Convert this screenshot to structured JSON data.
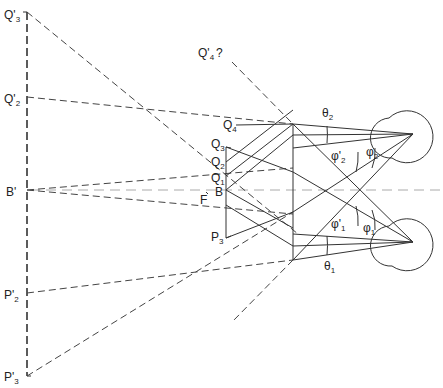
{
  "diagram": {
    "labels": {
      "Q3p": {
        "main": "Q'",
        "sub": "3"
      },
      "Q2p": {
        "main": "Q'",
        "sub": "2"
      },
      "Bp": {
        "main": "B'"
      },
      "P2p": {
        "main": "P'",
        "sub": "2"
      },
      "P3p": {
        "main": "P'",
        "sub": "3"
      },
      "Q4p": {
        "main": "Q'",
        "sub": "4",
        "suffix": "?"
      },
      "Q4": {
        "main": "Q",
        "sub": "4"
      },
      "Q3": {
        "main": "Q",
        "sub": "3"
      },
      "Q2": {
        "main": "Q",
        "sub": "2"
      },
      "Q1": {
        "main": "Q",
        "sub": "1"
      },
      "B": {
        "main": "B"
      },
      "F": {
        "main": "F"
      },
      "P3": {
        "main": "P",
        "sub": "3"
      },
      "theta2": {
        "main": "θ",
        "sub": "2"
      },
      "theta1": {
        "main": "θ",
        "sub": "1"
      },
      "phi2p": {
        "main": "φ'",
        "sub": "2"
      },
      "phi2": {
        "main": "φ",
        "sub": "2"
      },
      "phi1p": {
        "main": "φ'",
        "sub": "1"
      },
      "phi1": {
        "main": "φ",
        "sub": "1"
      }
    },
    "colors": {
      "line": "#333333",
      "axis": "#aaaaaa",
      "background": "#ffffff"
    }
  }
}
